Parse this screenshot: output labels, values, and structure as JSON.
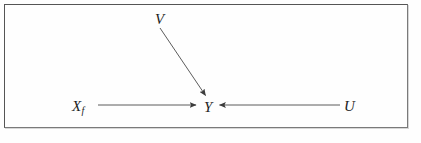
{
  "figure": {
    "type": "causal-diagram",
    "frame": {
      "border_color": "#6b6b6b",
      "background": "#fefefe"
    },
    "line_color": "#4a4a4a",
    "nodes": [
      {
        "id": "V",
        "label": "V",
        "sub": "",
        "x": 160,
        "y": 19
      },
      {
        "id": "Xf",
        "label": "X",
        "sub": "f",
        "x": 80,
        "y": 106
      },
      {
        "id": "Y",
        "label": "Y",
        "sub": "",
        "x": 208,
        "y": 107
      },
      {
        "id": "U",
        "label": "U",
        "sub": "",
        "x": 349,
        "y": 106
      }
    ],
    "edges": [
      {
        "from": "V",
        "to": "Y",
        "x1": 160,
        "y1": 27,
        "x2": 206,
        "y2": 96,
        "arrowhead": "target"
      },
      {
        "from": "Xf",
        "to": "Y",
        "x1": 98,
        "y1": 105,
        "x2": 196,
        "y2": 105,
        "arrowhead": "target"
      },
      {
        "from": "U",
        "to": "Y",
        "x1": 340,
        "y1": 105,
        "x2": 220,
        "y2": 105,
        "arrowhead": "target"
      }
    ]
  }
}
